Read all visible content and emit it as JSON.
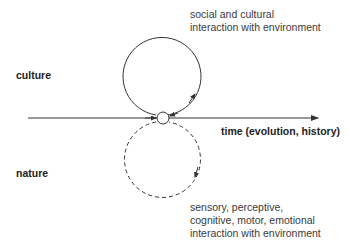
{
  "diagram": {
    "colors": {
      "background": "#ffffff",
      "stroke": "#333333",
      "text": "#3a3a3a",
      "bold_text": "#222222"
    },
    "axis": {
      "label": "time (evolution, history)",
      "x_start": 28,
      "x_end": 318,
      "y": 118
    },
    "node": {
      "cx": 163,
      "cy": 118,
      "r": 6
    },
    "upper_loop": {
      "label": "culture",
      "style": "solid",
      "description_lines": [
        "social and cultural",
        "interaction with environment"
      ],
      "cx": 162,
      "cy": 76,
      "r": 39
    },
    "lower_loop": {
      "label": "nature",
      "style": "dashed",
      "description_lines": [
        "sensory, perceptive,",
        "cognitive, motor, emotional",
        "interaction with environment"
      ],
      "cx": 162,
      "cy": 160,
      "r": 38
    }
  }
}
